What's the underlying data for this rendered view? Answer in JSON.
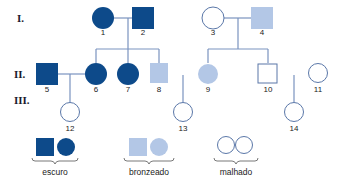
{
  "colors": {
    "dark": "#0d4a8a",
    "light": "#b3c7e6",
    "line": "#7a93bf",
    "outline": "#5a77a8"
  },
  "generations": [
    {
      "label": "I."
    },
    {
      "label": "II."
    },
    {
      "label": "III."
    }
  ],
  "individuals": [
    {
      "id": "1",
      "sex": "female",
      "phenotype": "escuro"
    },
    {
      "id": "2",
      "sex": "male",
      "phenotype": "escuro"
    },
    {
      "id": "3",
      "sex": "female",
      "phenotype": "malhado"
    },
    {
      "id": "4",
      "sex": "male",
      "phenotype": "bronzeado"
    },
    {
      "id": "5",
      "sex": "male",
      "phenotype": "escuro"
    },
    {
      "id": "6",
      "sex": "female",
      "phenotype": "escuro"
    },
    {
      "id": "7",
      "sex": "female",
      "phenotype": "escuro"
    },
    {
      "id": "8",
      "sex": "male",
      "phenotype": "bronzeado"
    },
    {
      "id": "9",
      "sex": "female",
      "phenotype": "bronzeado"
    },
    {
      "id": "10",
      "sex": "male",
      "phenotype": "malhado"
    },
    {
      "id": "11",
      "sex": "female",
      "phenotype": "malhado"
    },
    {
      "id": "12",
      "sex": "female",
      "phenotype": "malhado"
    },
    {
      "id": "13",
      "sex": "female",
      "phenotype": "malhado"
    },
    {
      "id": "14",
      "sex": "female",
      "phenotype": "malhado"
    }
  ],
  "legend": [
    {
      "label": "escuro"
    },
    {
      "label": "bronzeado"
    },
    {
      "label": "malhado"
    }
  ]
}
